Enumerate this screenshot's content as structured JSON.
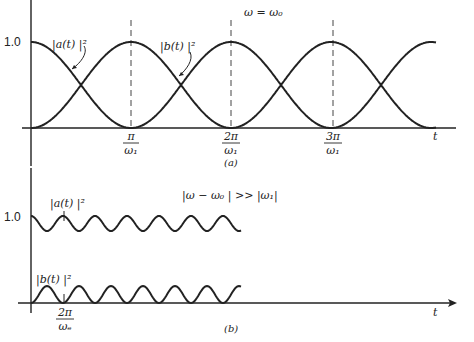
{
  "panel_a": {
    "caption": "(a)",
    "condition": "ω = ω₀",
    "y_tick": "1.0",
    "x_axis_label": "t",
    "curve_a_label": "|a(t) |²",
    "curve_b_label": "|b(t) |²",
    "x_ticks": [
      {
        "num": "π",
        "den": "ω₁"
      },
      {
        "num": "2π",
        "den": "ω₁"
      },
      {
        "num": "3π",
        "den": "ω₁"
      }
    ]
  },
  "panel_b": {
    "caption": "(b)",
    "condition": "|ω − ω₀ | >> |ω₁|",
    "y_tick": "1.0",
    "x_axis_label": "t",
    "curve_a_label": "|a(t) |²",
    "curve_b_label": "|b(t) |²",
    "x_tick": {
      "num": "2π",
      "den": "ωₑ"
    }
  },
  "colors": {
    "ink": "#222222",
    "background": "#ffffff"
  },
  "chart_data": [
    {
      "type": "line",
      "title": "ω = ω₀",
      "xlabel": "t",
      "ylabel": "",
      "ylim": [
        0,
        1.0
      ],
      "x_tick_labels": [
        "π/ω₁",
        "2π/ω₁",
        "3π/ω₁"
      ],
      "x": [
        0,
        0.5,
        1,
        1.5,
        2,
        2.5,
        3,
        3.5,
        4
      ],
      "x_units": "π/ω₁",
      "series": [
        {
          "name": "|a(t)|²",
          "values": [
            1.0,
            0.5,
            0.0,
            0.5,
            1.0,
            0.5,
            0.0,
            0.5,
            1.0
          ]
        },
        {
          "name": "|b(t)|²",
          "values": [
            0.0,
            0.5,
            1.0,
            0.5,
            0.0,
            0.5,
            1.0,
            0.5,
            0.0
          ]
        }
      ],
      "annotations": [
        "dashed vertical lines at π/ω₁, 2π/ω₁, 3π/ω₁"
      ]
    },
    {
      "type": "line",
      "title": "|ω − ω₀| >> |ω₁|",
      "xlabel": "t",
      "ylabel": "",
      "ylim": [
        0,
        1.0
      ],
      "x_tick_labels": [
        "2π/ωₑ"
      ],
      "x": [
        0,
        0.5,
        1,
        1.5,
        2,
        2.5,
        3,
        3.5,
        4,
        4.5,
        5,
        5.5
      ],
      "x_units": "2π/ωₑ",
      "series": [
        {
          "name": "|a(t)|²",
          "values": [
            1.0,
            0.83,
            1.0,
            0.83,
            1.0,
            0.83,
            1.0,
            0.83,
            1.0,
            0.83,
            1.0,
            0.83
          ]
        },
        {
          "name": "|b(t)|²",
          "values": [
            0.0,
            0.17,
            0.0,
            0.17,
            0.0,
            0.17,
            0.0,
            0.17,
            0.0,
            0.17,
            0.0,
            0.17
          ]
        }
      ]
    }
  ]
}
